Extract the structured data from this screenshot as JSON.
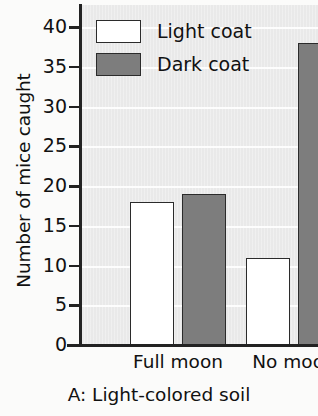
{
  "chart_data": {
    "type": "bar",
    "title": "",
    "caption": "A: Light-colored soil",
    "xlabel": "",
    "ylabel": "Number of mice caught",
    "categories": [
      "Full moon",
      "No moon"
    ],
    "series": [
      {
        "name": "Light coat",
        "values": [
          18,
          11
        ],
        "color": "#ffffff"
      },
      {
        "name": "Dark coat",
        "values": [
          19,
          38
        ],
        "color": "#7d7d7d"
      }
    ],
    "ylim": [
      0,
      40
    ],
    "yticks": [
      0,
      5,
      10,
      15,
      20,
      25,
      30,
      35,
      40
    ],
    "ytick_labels": [
      "0",
      "5",
      "10",
      "15",
      "20",
      "25",
      "30",
      "35",
      "40"
    ],
    "grid": true,
    "grid_axis": "y",
    "legend_position": "top-left-inside",
    "plot_background": "#e9e9e9",
    "bar_outline_color": "#2b2b2b",
    "axis_color": "#222222"
  },
  "legend": {
    "items": [
      {
        "label": "Light coat",
        "swatch": "light"
      },
      {
        "label": "Dark coat",
        "swatch": "dark"
      }
    ]
  },
  "axes": {
    "y_title": "Number of mice caught",
    "y_tick_labels": [
      "40",
      "35",
      "30",
      "25",
      "20",
      "15",
      "10",
      "5",
      "0"
    ],
    "x_tick_labels": [
      "Full moon",
      "No moon"
    ]
  },
  "caption": {
    "text": "A: Light-colored soil"
  }
}
